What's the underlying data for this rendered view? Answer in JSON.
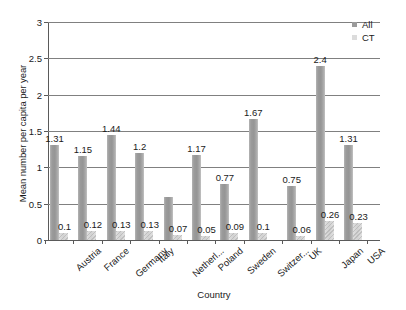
{
  "chart_data": {
    "type": "bar",
    "title": "",
    "xlabel": "Country",
    "ylabel": "Mean number per capita per year",
    "ylim": [
      0,
      3
    ],
    "yticks": [
      "0",
      "0.5",
      "1",
      "1.5",
      "2",
      "2.5",
      "3"
    ],
    "grid": true,
    "legend_position": "top-right",
    "categories": [
      "Austria",
      "France",
      "Germany",
      "Italy",
      "Netherl...",
      "Poland",
      "Sweden",
      "Switzer...",
      "UK",
      "Japan",
      "USA"
    ],
    "series": [
      {
        "name": "All",
        "color": "#9b9b9b",
        "values": [
          1.31,
          1.15,
          1.44,
          1.2,
          0.59,
          1.17,
          0.77,
          1.67,
          0.75,
          2.4,
          1.31
        ],
        "labels": [
          "1.31",
          "1.15",
          "1.44",
          "1.2",
          "",
          "1.17",
          "0.77",
          "1.67",
          "0.75",
          "2.4",
          "1.31"
        ]
      },
      {
        "name": "CT",
        "color": "#dcdcdc",
        "values": [
          0.1,
          0.12,
          0.13,
          0.13,
          0.07,
          0.05,
          0.09,
          0.1,
          0.06,
          0.26,
          0.23
        ],
        "labels": [
          "0.1",
          "0.12",
          "0.13",
          "0.13",
          "0.07",
          "0.05",
          "0.09",
          "0.1",
          "0.06",
          "0.26",
          "0.23"
        ]
      }
    ]
  },
  "legend": {
    "items": [
      {
        "label": "All",
        "swatch": "all"
      },
      {
        "label": "CT",
        "swatch": "ct"
      }
    ]
  }
}
